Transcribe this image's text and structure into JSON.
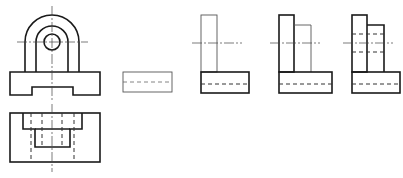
{
  "colors": {
    "background": "#ffffff",
    "visible_line": "#1a1a1a",
    "thin_line": "#555555",
    "hidden_line": "#333333",
    "center_line": "#444444"
  },
  "views": [
    {
      "id": "front-view",
      "label": "",
      "description": "Front view: base with bottom notch, upright with semicircular top and circular hole"
    },
    {
      "id": "top-view",
      "label": "",
      "description": "Top view: rectangle with stepped slot and hidden lines"
    },
    {
      "id": "side-step-1",
      "label": "",
      "description": "Side view construction step 1: base only"
    },
    {
      "id": "side-step-2",
      "label": "",
      "description": "Side view construction step 2: base + thin upright"
    },
    {
      "id": "side-step-3",
      "label": "",
      "description": "Side view construction step 3: base + upright + boss"
    },
    {
      "id": "side-step-4",
      "label": "",
      "description": "Side view construction step 4: complete with hidden hole lines"
    }
  ]
}
